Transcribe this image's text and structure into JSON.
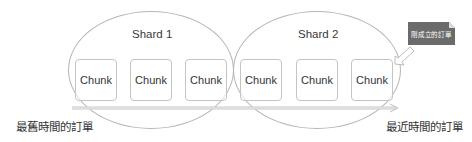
{
  "diagram": {
    "shards": [
      {
        "label": "Shard 1",
        "chunks": [
          "Chunk",
          "Chunk",
          "Chunk"
        ]
      },
      {
        "label": "Shard 2",
        "chunks": [
          "Chunk",
          "Chunk",
          "Chunk"
        ]
      }
    ],
    "timeline": {
      "start_label": "最舊時間的訂單",
      "end_label": "最近時間的訂單"
    },
    "callout": {
      "text": "剛成立的訂單",
      "target": "last chunk of Shard 2"
    },
    "colors": {
      "outline": "#b5b5b5",
      "chunk_border": "#c4c4c4",
      "callout_fill": "#6b6b6b",
      "text": "#333333"
    }
  }
}
